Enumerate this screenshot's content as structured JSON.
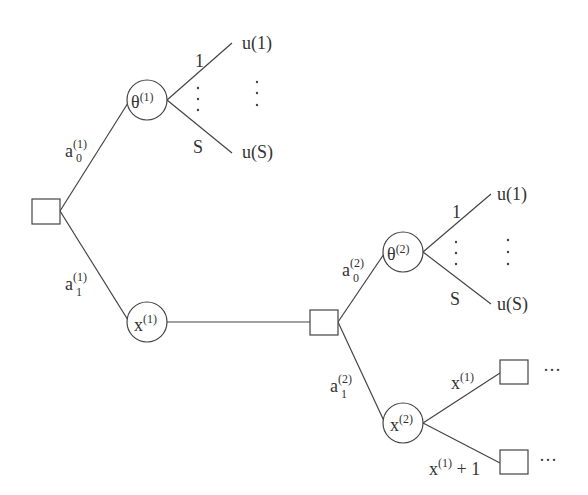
{
  "diagram": {
    "type": "decision-tree",
    "nodes": {
      "root_decision": {
        "shape": "square"
      },
      "theta1": {
        "shape": "circle",
        "label": "θ",
        "sup": "(1)"
      },
      "x1": {
        "shape": "circle",
        "label": "x",
        "sup": "(1)"
      },
      "decision2": {
        "shape": "square"
      },
      "theta2": {
        "shape": "circle",
        "label": "θ",
        "sup": "(2)"
      },
      "x2": {
        "shape": "circle",
        "label": "x",
        "sup": "(2)"
      },
      "leaf_decision_a": {
        "shape": "square",
        "trailing": "···"
      },
      "leaf_decision_b": {
        "shape": "square",
        "trailing": "···"
      }
    },
    "edges": {
      "a0_1": {
        "label": "a",
        "sub": "0",
        "sup": "(1)"
      },
      "a1_1": {
        "label": "a",
        "sub": "1",
        "sup": "(1)"
      },
      "a0_2": {
        "label": "a",
        "sub": "0",
        "sup": "(2)"
      },
      "a1_2": {
        "label": "a",
        "sub": "1",
        "sup": "(2)"
      },
      "theta1_top": {
        "label": "1"
      },
      "theta1_bottom": {
        "label": "S"
      },
      "theta2_top": {
        "label": "1"
      },
      "theta2_bottom": {
        "label": "S"
      },
      "x2_top": {
        "label": "x",
        "sup": "(1)"
      },
      "x2_bottom": {
        "label": "x",
        "sup": "(1)",
        "suffix": " + 1"
      }
    },
    "outcomes": {
      "theta1_u1": "u(1)",
      "theta1_uS": "u(S)",
      "theta2_u1": "u(1)",
      "theta2_uS": "u(S)"
    }
  }
}
